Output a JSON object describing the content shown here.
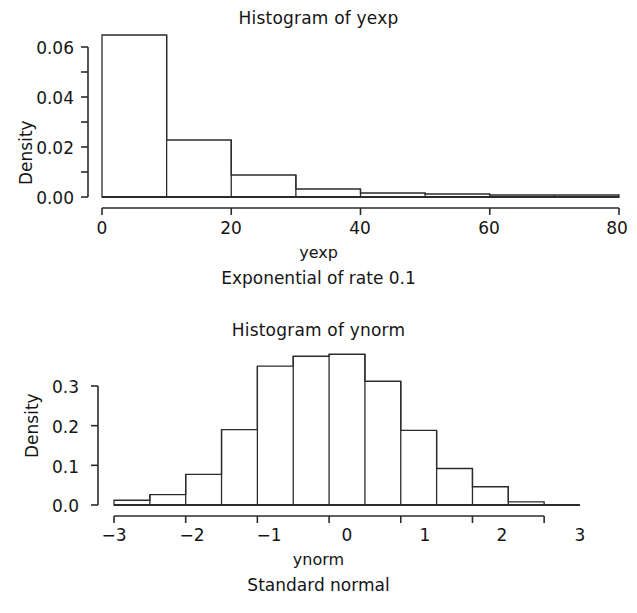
{
  "figure": {
    "background": "#ffffff",
    "ink_color": "#2b2b2b"
  },
  "panels": [
    {
      "id": "exp",
      "title": "Histogram of yexp",
      "xlabel": "yexp",
      "ylabel": "Density",
      "sublabel": "Exponential of rate 0.1"
    },
    {
      "id": "norm",
      "title": "Histogram of ynorm",
      "xlabel": "ynorm",
      "ylabel": "Density",
      "sublabel": "Standard normal"
    }
  ],
  "ticks": {
    "exp_x": [
      "0",
      "20",
      "40",
      "60",
      "80"
    ],
    "exp_y": [
      "0.00",
      "0.02",
      "0.04",
      "0.06"
    ],
    "norm_x": [
      "−3",
      "−2",
      "−1",
      "0",
      "1",
      "2",
      "3"
    ],
    "norm_y": [
      "0.0",
      "0.1",
      "0.2",
      "0.3"
    ]
  },
  "chart_data": [
    {
      "type": "bar",
      "subtype": "histogram",
      "title": "Histogram of yexp",
      "xlabel": "yexp",
      "ylabel": "Density",
      "annotation": "Exponential of rate 0.1",
      "xlim": [
        0,
        80
      ],
      "ylim": [
        0,
        0.065
      ],
      "xticks": [
        0,
        20,
        40,
        60,
        80
      ],
      "yticks": [
        0.0,
        0.02,
        0.04,
        0.06
      ],
      "yticks_minor": [
        0.01,
        0.03,
        0.05
      ],
      "grid": false,
      "legend": "none",
      "bin_width": 10,
      "bin_edges": [
        0,
        10,
        20,
        30,
        40,
        50,
        60,
        70,
        80
      ],
      "categories": [
        "0-10",
        "10-20",
        "20-30",
        "30-40",
        "40-50",
        "50-60",
        "60-70",
        "70-80"
      ],
      "values": [
        0.0648,
        0.0228,
        0.0088,
        0.0032,
        0.0016,
        0.0012,
        0.0008,
        0.0008
      ]
    },
    {
      "type": "bar",
      "subtype": "histogram",
      "title": "Histogram of ynorm",
      "xlabel": "ynorm",
      "ylabel": "Density",
      "annotation": "Standard normal",
      "xlim": [
        -3,
        3.5
      ],
      "ylim": [
        0,
        0.385
      ],
      "xticks": [
        -3,
        -2,
        -1,
        0,
        1,
        2,
        3
      ],
      "yticks": [
        0.0,
        0.1,
        0.2,
        0.3
      ],
      "grid": false,
      "legend": "none",
      "bin_width": 0.5,
      "bin_edges": [
        -3,
        -2.5,
        -2,
        -1.5,
        -1,
        -0.5,
        0,
        0.5,
        1,
        1.5,
        2,
        2.5,
        3
      ],
      "categories": [
        "-3--2.5",
        "-2.5--2",
        "-2--1.5",
        "-1.5--1",
        "-1--0.5",
        "-0.5-0",
        "0-0.5",
        "0.5-1",
        "1-1.5",
        "1.5-2",
        "2-2.5",
        "2.5-3"
      ],
      "values": [
        0.012,
        0.026,
        0.077,
        0.19,
        0.35,
        0.375,
        0.38,
        0.312,
        0.188,
        0.092,
        0.046,
        0.008
      ]
    }
  ]
}
